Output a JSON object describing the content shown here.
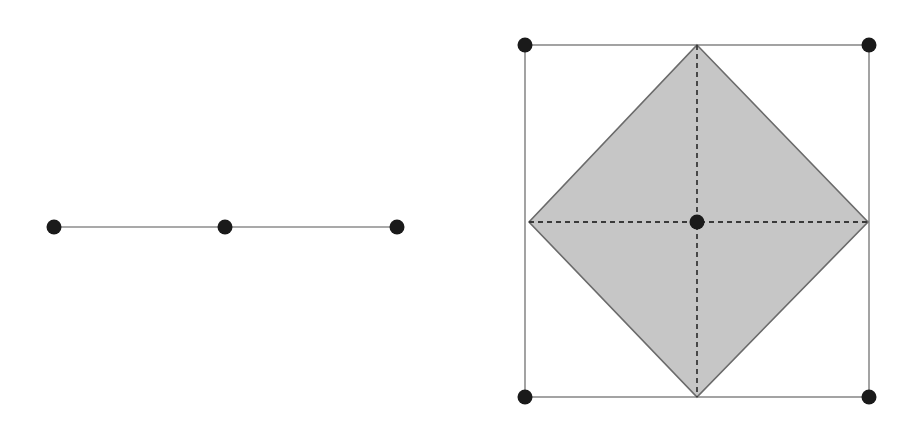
{
  "canvas": {
    "width": 913,
    "height": 422,
    "background": "#ffffff"
  },
  "style": {
    "vertex_color": "#1a1a1a",
    "vertex_radius": 7.5,
    "edge_color": "#8c8c8c",
    "edge_width": 1.6,
    "dashed_color": "#3a3a3a",
    "dashed_width": 1.8,
    "dash_pattern": "5,4",
    "diamond_fill": "#c6c6c6",
    "diamond_stroke": "#6b6b6b",
    "diamond_stroke_width": 1.6
  },
  "chart_data": {
    "type": "scatter",
    "title": "",
    "subtitle": "",
    "xlabel": "",
    "ylabel": "",
    "grid": false,
    "legend": "none",
    "xlim": [
      0,
      913
    ],
    "ylim": [
      0,
      422
    ],
    "series": [
      {
        "name": "figure-1-vertices",
        "points": [
          {
            "label": "left-endpoint",
            "x": 54,
            "y": 227
          },
          {
            "label": "midpoint",
            "x": 225,
            "y": 227
          },
          {
            "label": "right-endpoint",
            "x": 397,
            "y": 227
          }
        ]
      },
      {
        "name": "figure-2-square-corners",
        "points": [
          {
            "label": "top-left",
            "x": 525,
            "y": 45
          },
          {
            "label": "top-right",
            "x": 869,
            "y": 45
          },
          {
            "label": "bottom-right",
            "x": 869,
            "y": 397
          },
          {
            "label": "bottom-left",
            "x": 525,
            "y": 397
          }
        ]
      },
      {
        "name": "figure-2-diamond-vertices",
        "points": [
          {
            "label": "top",
            "x": 697,
            "y": 45
          },
          {
            "label": "right",
            "x": 868,
            "y": 222
          },
          {
            "label": "bottom",
            "x": 697,
            "y": 397
          },
          {
            "label": "left",
            "x": 529,
            "y": 222
          }
        ]
      },
      {
        "name": "figure-2-center",
        "points": [
          {
            "label": "center",
            "x": 697,
            "y": 222
          }
        ]
      }
    ]
  },
  "figure1": {
    "name": "line-segment-figure",
    "segment": {
      "x1": 54,
      "y1": 227,
      "x2": 397,
      "y2": 227
    },
    "vertices": [
      {
        "cx": 54,
        "cy": 227
      },
      {
        "cx": 225,
        "cy": 227
      },
      {
        "cx": 397,
        "cy": 227
      }
    ]
  },
  "figure2": {
    "name": "diamond-in-square-figure",
    "square": {
      "x": 525,
      "y": 45,
      "width": 344,
      "height": 352
    },
    "diamond_path": "M 697 45 L 868 222 L 697 397 L 529 222 Z",
    "diagonal_horizontal": {
      "x1": 529,
      "y1": 222,
      "x2": 868,
      "y2": 222
    },
    "diagonal_vertical": {
      "x1": 697,
      "y1": 45,
      "x2": 697,
      "y2": 397
    },
    "corner_vertices": [
      {
        "cx": 525,
        "cy": 45
      },
      {
        "cx": 869,
        "cy": 45
      },
      {
        "cx": 869,
        "cy": 397
      },
      {
        "cx": 525,
        "cy": 397
      }
    ],
    "center_vertex": {
      "cx": 697,
      "cy": 222
    }
  }
}
